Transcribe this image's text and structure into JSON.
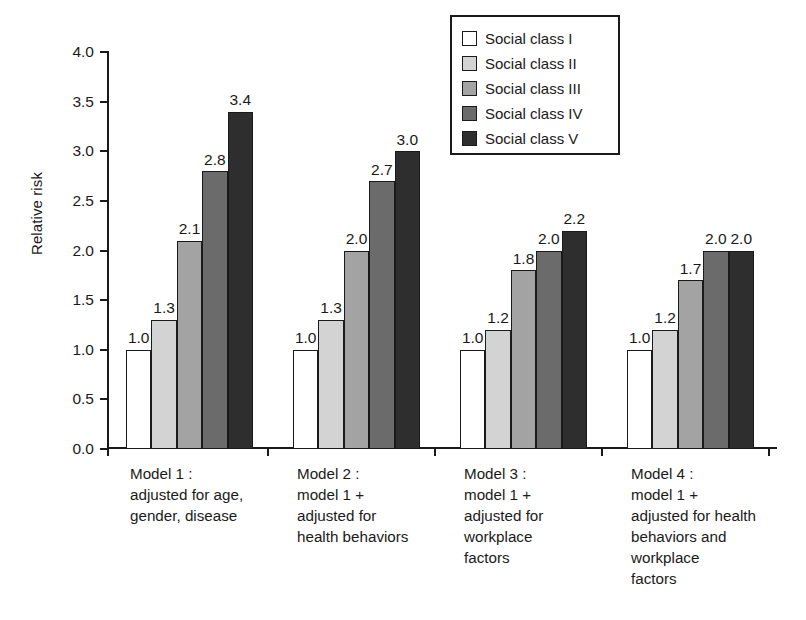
{
  "chart_data": {
    "type": "bar",
    "title": "",
    "xlabel": "",
    "ylabel": "Relative risk",
    "ylim": [
      0.0,
      4.0
    ],
    "ytick_labels": [
      "0.0",
      "0.5",
      "1.0",
      "1.5",
      "2.0",
      "2.5",
      "3.0",
      "3.5",
      "4.0"
    ],
    "ytick_values": [
      0.0,
      0.5,
      1.0,
      1.5,
      2.0,
      2.5,
      3.0,
      3.5,
      4.0
    ],
    "grid": false,
    "legend_position": "top-right",
    "categories": [
      "Model 1 :\nadjusted for age,\ngender, disease",
      "Model 2 :\nmodel 1 +\nadjusted for\nhealth behaviors",
      "Model 3 :\nmodel 1 +\nadjusted for\nworkplace\nfactors",
      "Model 4 :\nmodel 1 +\nadjusted for health\nbehaviors and\nworkplace\nfactors"
    ],
    "series": [
      {
        "name": "Social class I",
        "color": "#ffffff",
        "values": [
          1.0,
          1.0,
          1.0,
          1.0
        ],
        "labels": [
          "1.0",
          "1.0",
          "1.0",
          "1.0"
        ]
      },
      {
        "name": "Social class II",
        "color": "#d3d3d3",
        "values": [
          1.3,
          1.3,
          1.2,
          1.2
        ],
        "labels": [
          "1.3",
          "1.3",
          "1.2",
          "1.2"
        ]
      },
      {
        "name": "Social class III",
        "color": "#a3a3a3",
        "values": [
          2.1,
          2.0,
          1.8,
          1.7
        ],
        "labels": [
          "2.1",
          "2.0",
          "1.8",
          "1.7"
        ]
      },
      {
        "name": "Social class IV",
        "color": "#6b6b6b",
        "values": [
          2.8,
          2.7,
          2.0,
          2.0
        ],
        "labels": [
          "2.8",
          "2.7",
          "2.0",
          "2.0"
        ]
      },
      {
        "name": "Social class V",
        "color": "#2e2e2e",
        "values": [
          3.4,
          3.0,
          2.2,
          2.0
        ],
        "labels": [
          "3.4",
          "3.0",
          "2.2",
          "2.0"
        ]
      }
    ]
  },
  "legend": {
    "items": [
      {
        "label": "Social class I",
        "color": "#ffffff"
      },
      {
        "label": "Social class II",
        "color": "#d3d3d3"
      },
      {
        "label": "Social class III",
        "color": "#a3a3a3"
      },
      {
        "label": "Social class IV",
        "color": "#6b6b6b"
      },
      {
        "label": "Social class V",
        "color": "#2e2e2e"
      }
    ]
  },
  "axes": {
    "y_title": "Relative risk"
  }
}
